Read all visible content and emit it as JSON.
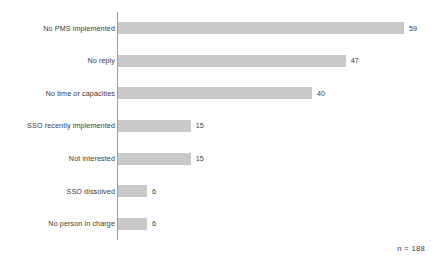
{
  "chart_data": {
    "type": "bar",
    "orientation": "horizontal",
    "title": "",
    "xlabel": "",
    "ylabel": "",
    "xlim": [
      0,
      62
    ],
    "grid": false,
    "legend": null,
    "categories": [
      "No PMS implemented",
      "No reply",
      "No time or capacities",
      "SSO recently implemented",
      "Not interested",
      "SSO dissolved",
      "No person in charge"
    ],
    "values": [
      59,
      47,
      40,
      15,
      15,
      6,
      6
    ],
    "value_labels": [
      "59",
      "47",
      "40",
      "15",
      "15",
      "6",
      "6"
    ],
    "annotations": [
      "n = 188"
    ],
    "colors": {
      "bar": "#c9c9c9",
      "axis": "#9a9a9a",
      "text": "#3a3a3a",
      "background": "#ffffff"
    }
  },
  "footnote": "n = 188"
}
